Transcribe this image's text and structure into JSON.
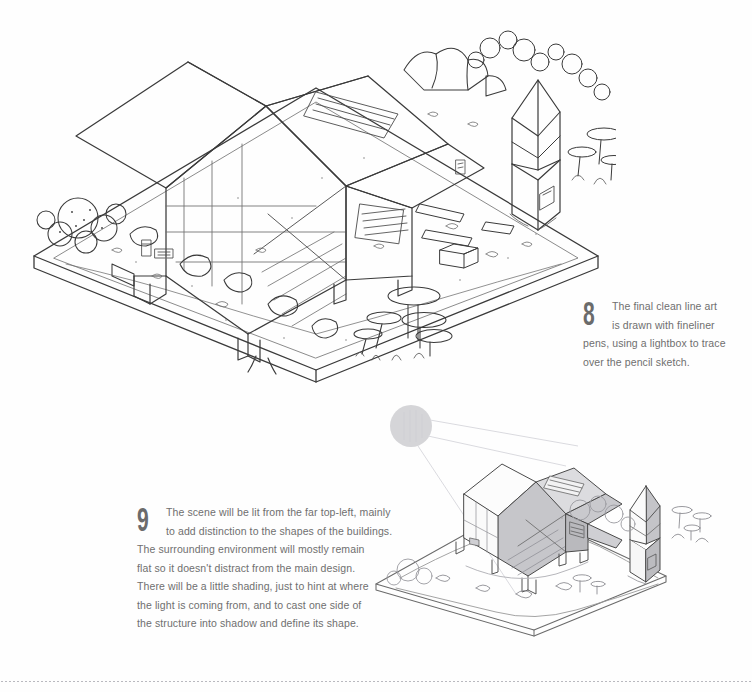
{
  "page": {
    "background_color": "#fefefe",
    "ink_color": "#3a3a3a",
    "text_color": "#6f6f6f",
    "shade_color": "#c9c9cd",
    "footer_rule": "dotted-divider"
  },
  "captions": [
    {
      "number": "8",
      "lines": [
        "The final clean line art",
        "is drawn with fineliner",
        "pens, using a lightbox to trace",
        "over the pencil sketch."
      ]
    },
    {
      "number": "9",
      "lines": [
        "The scene will be lit from the far top-left, mainly",
        "to add distinction to the shapes of the buildings.",
        "The surrounding environment will mostly remain",
        "flat so it doesn't distract from the main design.",
        "There will be a little shading, just to hint at where",
        "the light is coming from, and to cast one side of",
        "the structure into shadow and define its shape."
      ]
    }
  ],
  "illustrations": {
    "main": {
      "name": "clean-line-art-isometric-scene",
      "style": "fineliner outline, no shading",
      "elements": [
        "isometric ground slab",
        "a-frame cabin with glass gable",
        "roof skylight slats",
        "louvered wall vent",
        "stilt legs",
        "small pointed tower outbuilding",
        "giant mushroom cluster",
        "boulders and rocks",
        "bushes and shrubs",
        "scattered debris"
      ]
    },
    "shaded": {
      "name": "shaded-lighting-study",
      "style": "grey tonal shading from top-left light source",
      "elements": [
        "sun light source circle",
        "light rays",
        "a-frame cabin shaded right faces",
        "pointed tower outbuilding shaded",
        "isometric ground slab",
        "mushrooms",
        "cast shadows"
      ]
    }
  }
}
